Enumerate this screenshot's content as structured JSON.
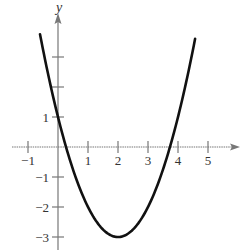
{
  "chart_data": {
    "type": "line",
    "title": "",
    "function": "y = x^2 - 4x + 1",
    "xlabel": "",
    "ylabel": "y",
    "xlim": [
      -1.2,
      6.0
    ],
    "ylim": [
      -3.4,
      4.4
    ],
    "x_ticks": [
      -1,
      1,
      2,
      3,
      4,
      5
    ],
    "x_tick_labels": [
      "−1",
      "1",
      "2",
      "3",
      "4",
      "5"
    ],
    "y_ticks": [
      -3,
      -2,
      -1,
      1,
      2,
      3
    ],
    "y_tick_labels": [
      "−3",
      "−2",
      "−1",
      "1",
      "",
      ""
    ],
    "grid": false,
    "legend": null,
    "series": [
      {
        "name": "parabola",
        "x": [
          -0.6,
          -0.2,
          0,
          0.27,
          0.5,
          1,
          1.5,
          2,
          2.5,
          3,
          3.5,
          3.73,
          4,
          4.3,
          4.57
        ],
        "y": [
          3.76,
          1.84,
          1,
          0,
          -0.75,
          -2,
          -2.75,
          -3,
          -2.75,
          -2,
          -0.75,
          0,
          1,
          2.29,
          3.6
        ]
      }
    ],
    "key_points": {
      "vertex": [
        2,
        -3
      ],
      "y_intercept": [
        0,
        1
      ],
      "x_intercepts": [
        0.27,
        3.73
      ]
    },
    "colors": {
      "curve": "#111111",
      "axes": "#777777",
      "text": "#333333"
    }
  }
}
